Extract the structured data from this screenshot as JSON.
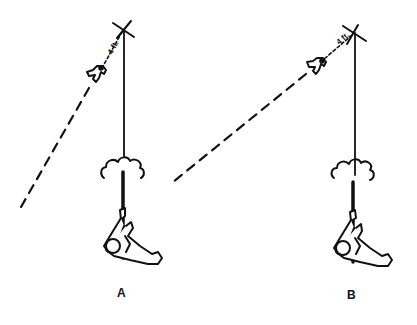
{
  "diagram": {
    "panels": [
      {
        "label": "A",
        "distance_label": "4 ft.",
        "pivot": {
          "x": 123,
          "y": 30
        },
        "bird": {
          "x": 96,
          "y": 74
        },
        "trajectory": {
          "x1": 88,
          "y1": 86,
          "x2": 20,
          "y2": 207
        }
      },
      {
        "label": "B",
        "distance_label": "4 ft.",
        "pivot": {
          "x": 353,
          "y": 33
        },
        "bird": {
          "x": 316,
          "y": 66
        },
        "trajectory": {
          "x1": 305,
          "y1": 74,
          "x2": 172,
          "y2": 182
        }
      }
    ],
    "colors": {
      "line": "#111111",
      "background": "#ffffff"
    }
  }
}
